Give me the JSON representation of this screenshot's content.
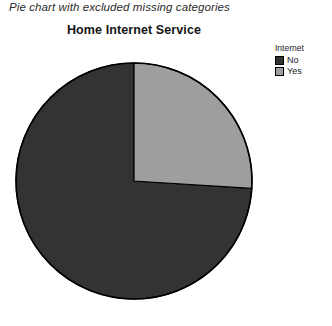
{
  "caption": "Pie chart with excluded missing categories",
  "chart_title": "Home Internet Service",
  "legend": {
    "title": "Internet",
    "items": [
      {
        "label": "No",
        "color": "#333333"
      },
      {
        "label": "Yes",
        "color": "#9e9e9e"
      }
    ]
  },
  "colors": {
    "slice_no": "#333333",
    "slice_yes": "#9e9e9e",
    "outline": "#000000",
    "background": "#ffffff",
    "text": "#1a1a1a"
  },
  "chart_data": {
    "type": "pie",
    "title": "Home Internet Service",
    "legend_title": "Internet",
    "legend_position": "right",
    "labels": [
      "No",
      "Yes"
    ],
    "values": [
      74,
      26
    ],
    "unit": "percent",
    "colors": [
      "#333333",
      "#9e9e9e"
    ],
    "start_angle_deg": 0,
    "direction": "counterclockwise",
    "slices": [
      {
        "label": "No",
        "value": 74,
        "color": "#333333",
        "start_deg": 0,
        "end_deg": 266.4
      },
      {
        "label": "Yes",
        "value": 26,
        "color": "#9e9e9e",
        "start_deg": 266.4,
        "end_deg": 360
      }
    ],
    "annotations": [],
    "grid": false,
    "notes": "Pie chart with excluded missing categories"
  },
  "geometry": {
    "center_x": 121,
    "center_y": 121,
    "radius": 118
  }
}
